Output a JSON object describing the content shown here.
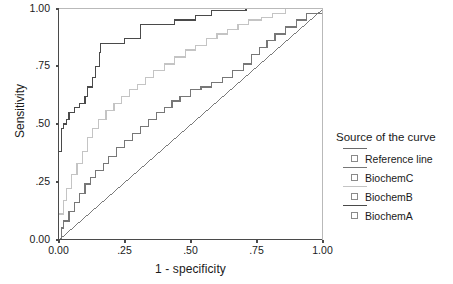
{
  "chart_data": {
    "type": "line",
    "title": "",
    "xlabel": "1 - specificity",
    "ylabel": "Sensitivity",
    "xlim": [
      0,
      1
    ],
    "ylim": [
      0,
      1
    ],
    "grid": false,
    "xticks": [
      "0.00",
      ".25",
      ".50",
      ".75",
      "1.00"
    ],
    "xtick_values": [
      0,
      0.25,
      0.5,
      0.75,
      1
    ],
    "yticks": [
      "0.00",
      ".25",
      ".50",
      ".75",
      "1.00"
    ],
    "ytick_values": [
      0,
      0.25,
      0.5,
      0.75,
      1
    ],
    "legend_title": "Source of the curve",
    "legend_position": "right",
    "series": [
      {
        "name": "Reference line",
        "color": "#6b6b6b",
        "style": "diagonal",
        "points": [
          [
            0,
            0
          ],
          [
            1,
            1
          ]
        ]
      },
      {
        "name": "BiochemC",
        "color": "#777777",
        "style": "step",
        "points": [
          [
            0.0,
            0.0
          ],
          [
            0.01,
            0.0
          ],
          [
            0.01,
            0.05
          ],
          [
            0.02,
            0.05
          ],
          [
            0.02,
            0.08
          ],
          [
            0.04,
            0.08
          ],
          [
            0.04,
            0.12
          ],
          [
            0.06,
            0.12
          ],
          [
            0.06,
            0.16
          ],
          [
            0.08,
            0.16
          ],
          [
            0.08,
            0.2
          ],
          [
            0.1,
            0.2
          ],
          [
            0.1,
            0.24
          ],
          [
            0.12,
            0.24
          ],
          [
            0.12,
            0.27
          ],
          [
            0.14,
            0.27
          ],
          [
            0.14,
            0.3
          ],
          [
            0.17,
            0.3
          ],
          [
            0.17,
            0.33
          ],
          [
            0.19,
            0.33
          ],
          [
            0.19,
            0.36
          ],
          [
            0.22,
            0.36
          ],
          [
            0.22,
            0.4
          ],
          [
            0.25,
            0.4
          ],
          [
            0.25,
            0.43
          ],
          [
            0.28,
            0.43
          ],
          [
            0.28,
            0.46
          ],
          [
            0.31,
            0.46
          ],
          [
            0.31,
            0.49
          ],
          [
            0.34,
            0.49
          ],
          [
            0.34,
            0.52
          ],
          [
            0.37,
            0.52
          ],
          [
            0.37,
            0.55
          ],
          [
            0.4,
            0.55
          ],
          [
            0.4,
            0.57
          ],
          [
            0.43,
            0.57
          ],
          [
            0.43,
            0.6
          ],
          [
            0.46,
            0.6
          ],
          [
            0.46,
            0.62
          ],
          [
            0.5,
            0.62
          ],
          [
            0.5,
            0.65
          ],
          [
            0.54,
            0.65
          ],
          [
            0.54,
            0.66
          ],
          [
            0.58,
            0.66
          ],
          [
            0.58,
            0.68
          ],
          [
            0.62,
            0.68
          ],
          [
            0.62,
            0.7
          ],
          [
            0.66,
            0.7
          ],
          [
            0.66,
            0.73
          ],
          [
            0.7,
            0.73
          ],
          [
            0.7,
            0.76
          ],
          [
            0.73,
            0.76
          ],
          [
            0.73,
            0.8
          ],
          [
            0.76,
            0.8
          ],
          [
            0.76,
            0.83
          ],
          [
            0.79,
            0.83
          ],
          [
            0.79,
            0.86
          ],
          [
            0.82,
            0.86
          ],
          [
            0.82,
            0.89
          ],
          [
            0.86,
            0.89
          ],
          [
            0.86,
            0.92
          ],
          [
            0.9,
            0.92
          ],
          [
            0.9,
            0.95
          ],
          [
            0.94,
            0.95
          ],
          [
            0.94,
            0.98
          ],
          [
            1.0,
            0.98
          ],
          [
            1.0,
            1.0
          ]
        ]
      },
      {
        "name": "BiochemB",
        "color": "#c4c4c4",
        "style": "step",
        "points": [
          [
            0.0,
            0.0
          ],
          [
            0.0,
            0.11
          ],
          [
            0.02,
            0.11
          ],
          [
            0.02,
            0.17
          ],
          [
            0.03,
            0.17
          ],
          [
            0.03,
            0.22
          ],
          [
            0.05,
            0.22
          ],
          [
            0.05,
            0.28
          ],
          [
            0.07,
            0.28
          ],
          [
            0.07,
            0.33
          ],
          [
            0.09,
            0.33
          ],
          [
            0.09,
            0.38
          ],
          [
            0.11,
            0.38
          ],
          [
            0.11,
            0.44
          ],
          [
            0.13,
            0.44
          ],
          [
            0.13,
            0.48
          ],
          [
            0.15,
            0.48
          ],
          [
            0.15,
            0.52
          ],
          [
            0.18,
            0.52
          ],
          [
            0.18,
            0.56
          ],
          [
            0.21,
            0.56
          ],
          [
            0.21,
            0.59
          ],
          [
            0.24,
            0.59
          ],
          [
            0.24,
            0.62
          ],
          [
            0.27,
            0.62
          ],
          [
            0.27,
            0.65
          ],
          [
            0.3,
            0.65
          ],
          [
            0.3,
            0.67
          ],
          [
            0.33,
            0.67
          ],
          [
            0.33,
            0.7
          ],
          [
            0.36,
            0.7
          ],
          [
            0.36,
            0.73
          ],
          [
            0.4,
            0.73
          ],
          [
            0.4,
            0.76
          ],
          [
            0.44,
            0.76
          ],
          [
            0.44,
            0.79
          ],
          [
            0.48,
            0.79
          ],
          [
            0.48,
            0.82
          ],
          [
            0.52,
            0.82
          ],
          [
            0.52,
            0.84
          ],
          [
            0.56,
            0.84
          ],
          [
            0.56,
            0.87
          ],
          [
            0.6,
            0.87
          ],
          [
            0.6,
            0.89
          ],
          [
            0.64,
            0.89
          ],
          [
            0.64,
            0.91
          ],
          [
            0.68,
            0.91
          ],
          [
            0.68,
            0.93
          ],
          [
            0.72,
            0.93
          ],
          [
            0.72,
            0.95
          ],
          [
            0.77,
            0.95
          ],
          [
            0.77,
            0.96
          ],
          [
            0.81,
            0.96
          ],
          [
            0.81,
            0.98
          ],
          [
            0.86,
            0.98
          ],
          [
            0.86,
            1.0
          ],
          [
            1.0,
            1.0
          ]
        ]
      },
      {
        "name": "BiochemA",
        "color": "#4a4a4a",
        "style": "step",
        "points": [
          [
            0.0,
            0.0
          ],
          [
            0.0,
            0.38
          ],
          [
            0.01,
            0.38
          ],
          [
            0.01,
            0.48
          ],
          [
            0.02,
            0.48
          ],
          [
            0.02,
            0.5
          ],
          [
            0.03,
            0.5
          ],
          [
            0.03,
            0.52
          ],
          [
            0.04,
            0.52
          ],
          [
            0.04,
            0.55
          ],
          [
            0.06,
            0.55
          ],
          [
            0.06,
            0.57
          ],
          [
            0.08,
            0.57
          ],
          [
            0.08,
            0.59
          ],
          [
            0.1,
            0.59
          ],
          [
            0.1,
            0.62
          ],
          [
            0.11,
            0.62
          ],
          [
            0.11,
            0.66
          ],
          [
            0.13,
            0.66
          ],
          [
            0.13,
            0.7
          ],
          [
            0.14,
            0.7
          ],
          [
            0.14,
            0.75
          ],
          [
            0.155,
            0.75
          ],
          [
            0.155,
            0.81
          ],
          [
            0.16,
            0.81
          ],
          [
            0.16,
            0.85
          ],
          [
            0.25,
            0.85
          ],
          [
            0.25,
            0.87
          ],
          [
            0.31,
            0.87
          ],
          [
            0.31,
            0.93
          ],
          [
            0.44,
            0.93
          ],
          [
            0.44,
            0.95
          ],
          [
            0.52,
            0.95
          ],
          [
            0.52,
            0.97
          ],
          [
            0.58,
            0.97
          ],
          [
            0.58,
            0.99
          ],
          [
            0.71,
            0.99
          ],
          [
            0.71,
            1.0
          ],
          [
            1.0,
            1.0
          ]
        ]
      }
    ]
  },
  "axes": {
    "x_title": "1 - specificity",
    "y_title": "Sensitivity",
    "x_ticks": [
      "0.00",
      ".25",
      ".50",
      ".75",
      "1.00"
    ],
    "y_ticks": [
      "0.00",
      ".25",
      ".50",
      ".75",
      "1.00"
    ]
  },
  "legend": {
    "title": "Source of the curve",
    "items": [
      {
        "label": "Reference line",
        "color": "#6b6b6b"
      },
      {
        "label": "BiochemC",
        "color": "#777777"
      },
      {
        "label": "BiochemB",
        "color": "#c4c4c4"
      },
      {
        "label": "BiochemA",
        "color": "#4a4a4a"
      }
    ]
  },
  "colors": {
    "axis": "#4a4a4a",
    "background": "#ffffff",
    "text": "#1a1a1a"
  }
}
